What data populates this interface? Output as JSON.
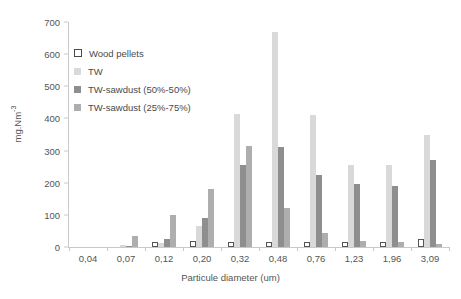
{
  "chart_data": {
    "type": "bar",
    "title": "",
    "xlabel": "Particule diameter (um)",
    "ylabel": "mg.Nm-3",
    "ylabel_base": "mg.Nm",
    "ylabel_exponent": "-3",
    "ylim": [
      0,
      700
    ],
    "ytick_step": 100,
    "yticks": [
      "0",
      "100",
      "200",
      "300",
      "400",
      "500",
      "600",
      "700"
    ],
    "grid": false,
    "legend_position": "inside-top-left",
    "categories": [
      "0,04",
      "0,07",
      "0,12",
      "0,20",
      "0,32",
      "0,48",
      "0,76",
      "1,23",
      "1,96",
      "3,09"
    ],
    "series": [
      {
        "name": "Wood pellets",
        "color": "#ffffff",
        "border_color": "#555555",
        "values": [
          0,
          0,
          8,
          20,
          10,
          12,
          8,
          8,
          10,
          25
        ]
      },
      {
        "name": "TW",
        "color": "#d9d9d9",
        "values": [
          0,
          5,
          12,
          65,
          415,
          670,
          410,
          255,
          255,
          350
        ]
      },
      {
        "name": "TW-sawdust (50%-50%)",
        "color": "#8e8e8e",
        "values": [
          0,
          3,
          25,
          90,
          255,
          310,
          225,
          195,
          190,
          270
        ]
      },
      {
        "name": "TW-sawdust (25%-75%)",
        "color": "#aeaeae",
        "values": [
          0,
          35,
          100,
          180,
          315,
          120,
          45,
          18,
          15,
          10
        ]
      }
    ]
  }
}
